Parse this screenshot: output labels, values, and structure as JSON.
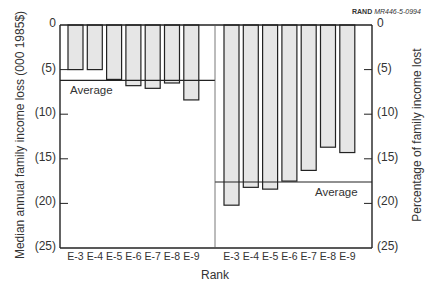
{
  "credit": {
    "org": "RAND",
    "code": "MR446-5-0994"
  },
  "chart_data": [
    {
      "type": "bar",
      "panel": "left",
      "title": "",
      "xlabel": "Rank",
      "ylabel": "Median annual family income loss (000 1985$)",
      "categories": [
        "E-3",
        "E-4",
        "E-5",
        "E-6",
        "E-7",
        "E-8",
        "E-9"
      ],
      "values": [
        5.0,
        5.0,
        6.1,
        6.8,
        7.1,
        6.5,
        8.4
      ],
      "average": 6.2,
      "average_label": "Average",
      "ylim": [
        0,
        25
      ],
      "y_inverted": true,
      "yticks": [
        "0",
        "(5)",
        "(10)",
        "(15)",
        "(20)",
        "(25)"
      ],
      "grid": false
    },
    {
      "type": "bar",
      "panel": "right",
      "title": "",
      "xlabel": "Rank",
      "ylabel": "Percentage of family income lost",
      "categories": [
        "E-3",
        "E-4",
        "E-5",
        "E-6",
        "E-7",
        "E-8",
        "E-9"
      ],
      "values": [
        20.2,
        18.2,
        18.4,
        17.5,
        16.3,
        13.7,
        14.3
      ],
      "average": 17.6,
      "average_label": "Average",
      "ylim": [
        0,
        25
      ],
      "y_inverted": true,
      "yticks": [
        "0",
        "(5)",
        "(10)",
        "(15)",
        "(20)",
        "(25)"
      ],
      "grid": false
    }
  ],
  "axes": {
    "left_ylabel": "Median annual family income loss (000 1985$)",
    "right_ylabel": "Percentage of family income lost",
    "xlabel": "Rank",
    "left_ticks": [
      "0",
      "(5)",
      "(10)",
      "(15)",
      "(20)",
      "(25)"
    ],
    "right_ticks": [
      "0",
      "(5)",
      "(10)",
      "(15)",
      "(20)",
      "(25)"
    ],
    "left_categories": [
      "E-3",
      "E-4",
      "E-5",
      "E-6",
      "E-7",
      "E-8",
      "E-9"
    ],
    "right_categories": [
      "E-3",
      "E-4",
      "E-5",
      "E-6",
      "E-7",
      "E-8",
      "E-9"
    ],
    "average_label": "Average"
  },
  "colors": {
    "bar_fill": "#e6e6e6",
    "bar_stroke": "#222222",
    "axis": "#222222"
  }
}
